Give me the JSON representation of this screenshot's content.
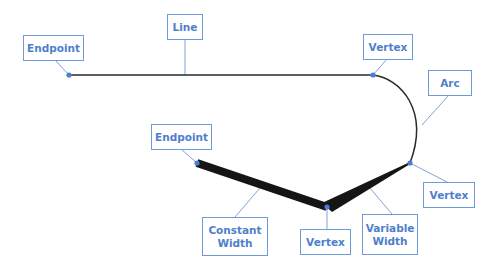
{
  "diagram": {
    "type": "polyline-anatomy",
    "colors": {
      "label_text": "#4f7fcb",
      "label_border": "#6f9ad8",
      "leader_line": "#7ea3dc",
      "vertex_dot": "#4a7fd0",
      "geometry_stroke": "#1a1a1a",
      "background": "#ffffff"
    },
    "labels": {
      "endpoint_top": "Endpoint",
      "line": "Line",
      "vertex_top": "Vertex",
      "arc": "Arc",
      "vertex_right": "Vertex",
      "endpoint_lower": "Endpoint",
      "constant_width": "Constant\nWidth",
      "vertex_bottom": "Vertex",
      "variable_width": "Variable\nWidth"
    },
    "points": {
      "endpoint_top": [
        69,
        75
      ],
      "vertex_top": [
        373,
        75
      ],
      "vertex_right": [
        410,
        163
      ],
      "endpoint_lower": [
        197,
        163
      ],
      "vertex_bottom": [
        327,
        207
      ]
    },
    "segments": [
      {
        "kind": "line",
        "from": "endpoint_top",
        "to": "vertex_top",
        "width": 1.5
      },
      {
        "kind": "arc",
        "from": "vertex_top",
        "to": "vertex_right",
        "width": 1.5
      },
      {
        "kind": "constant-width",
        "from": "endpoint_lower",
        "to": "vertex_bottom",
        "width": 8
      },
      {
        "kind": "variable-width",
        "from": "vertex_bottom",
        "to": "vertex_right",
        "start_width": 9,
        "end_width": 1
      }
    ]
  }
}
